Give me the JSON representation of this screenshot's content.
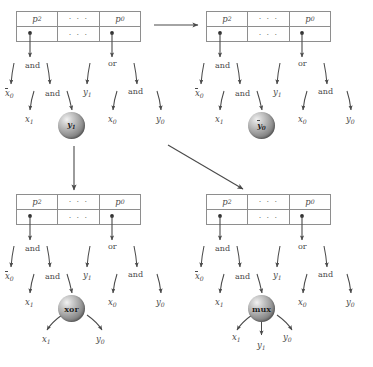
{
  "figure": {
    "type": "expression-tree-rewriting-diagram",
    "background_color": "#ffffff",
    "ink_color": "#4a4a4a",
    "sphere_color": "#a8a8a8"
  },
  "register": {
    "cells_top": [
      "p2",
      "...",
      "p0"
    ],
    "cells_bottom": [
      "",
      "...",
      ""
    ],
    "labels": {
      "p2_base": "p",
      "p2_sub": "2",
      "p0_base": "p",
      "p0_sub": "0",
      "ellipsis": "· · ·"
    }
  },
  "tree": {
    "operators": {
      "and_left": "and",
      "or_right": "or",
      "and_inner_left": "and",
      "and_inner_right": "and"
    },
    "leaves": {
      "x0_bar_base": "x",
      "x0_bar_sub": "0",
      "x1_base": "x",
      "x1_sub": "1",
      "y1_base": "y",
      "y1_sub": "1",
      "x0_base": "x",
      "x0_sub": "0",
      "y0_base": "y",
      "y0_sub": "0"
    }
  },
  "panels": [
    {
      "id": "top-left",
      "position": "top-left",
      "node_label": "y1",
      "node_base": "y",
      "node_sub": "1",
      "node_style": "italic",
      "node_overbar": false,
      "children": []
    },
    {
      "id": "top-right",
      "position": "top-right",
      "node_label": "y0-bar",
      "node_base": "y",
      "node_sub": "0",
      "node_style": "italic",
      "node_overbar": true,
      "children": []
    },
    {
      "id": "bottom-left",
      "position": "bottom-left",
      "node_label": "xor",
      "node_base": "xor",
      "node_sub": "",
      "node_style": "normal",
      "node_overbar": false,
      "children": [
        {
          "base": "x",
          "sub": "1"
        },
        {
          "base": "y",
          "sub": "0"
        }
      ]
    },
    {
      "id": "bottom-right",
      "position": "bottom-right",
      "node_label": "mux",
      "node_base": "mux",
      "node_sub": "",
      "node_style": "normal",
      "node_overbar": false,
      "children": [
        {
          "base": "x",
          "sub": "1"
        },
        {
          "base": "y",
          "sub": "1"
        },
        {
          "base": "y",
          "sub": "0"
        }
      ]
    }
  ],
  "transitions": [
    {
      "id": "tl-to-tr",
      "from": "top-left",
      "to": "top-right",
      "direction": "horizontal-right"
    },
    {
      "id": "tl-to-bl",
      "from": "top-left",
      "to": "bottom-left",
      "direction": "vertical-down"
    },
    {
      "id": "tl-to-br",
      "from": "top-left",
      "to": "bottom-right",
      "direction": "diagonal-down-right"
    }
  ]
}
